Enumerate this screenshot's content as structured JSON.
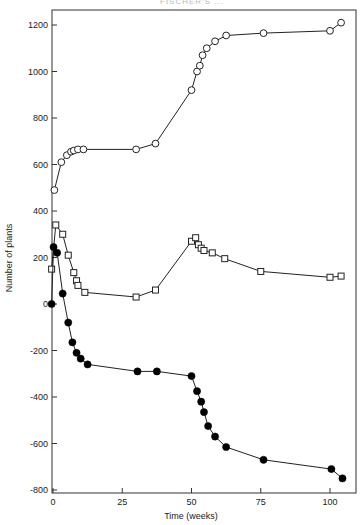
{
  "header": {
    "text": "FISCHER'S ..."
  },
  "chart_data": {
    "type": "line",
    "title": "",
    "xlabel": "Time  (weeks)",
    "ylabel": "Number of plants",
    "xlim": [
      0,
      109
    ],
    "ylim": [
      -800,
      1270
    ],
    "xticks": [
      0,
      25,
      50,
      75,
      100
    ],
    "yticks": [
      1200,
      1000,
      800,
      600,
      400,
      200,
      0,
      -200,
      -400,
      -600,
      -800
    ],
    "grid": false,
    "legend": "none",
    "series": [
      {
        "name": "open circles",
        "marker": "open-circle",
        "x": [
          0.5,
          3,
          5,
          6.5,
          7.5,
          9,
          11,
          30,
          37,
          50,
          52,
          53,
          54,
          55.5,
          58.5,
          62.5,
          76,
          100,
          104
        ],
        "y": [
          490,
          610,
          640,
          655,
          660,
          665,
          665,
          665,
          690,
          920,
          1000,
          1025,
          1070,
          1100,
          1130,
          1155,
          1165,
          1175,
          1210
        ]
      },
      {
        "name": "open squares",
        "marker": "open-square",
        "x": [
          -0.5,
          1,
          3.5,
          5.5,
          7.5,
          8.5,
          9,
          11.5,
          30,
          37,
          50,
          51.5,
          52.5,
          53.5,
          54.5,
          57.5,
          62,
          75,
          100,
          104
        ],
        "y": [
          150,
          340,
          300,
          210,
          135,
          100,
          80,
          50,
          30,
          60,
          270,
          285,
          255,
          240,
          230,
          220,
          195,
          140,
          115,
          120
        ]
      },
      {
        "name": "filled circles",
        "marker": "filled-circle",
        "x": [
          -0.5,
          0.2,
          1.5,
          3.5,
          5.5,
          7,
          8.5,
          10,
          12.5,
          30.5,
          37.5,
          50,
          52,
          53.5,
          54.5,
          56,
          58.5,
          62.5,
          76,
          100.5,
          104.5
        ],
        "y": [
          0,
          245,
          220,
          45,
          -80,
          -165,
          -210,
          -235,
          -260,
          -290,
          -290,
          -310,
          -375,
          -420,
          -465,
          -525,
          -570,
          -615,
          -670,
          -710,
          -750
        ]
      }
    ]
  }
}
